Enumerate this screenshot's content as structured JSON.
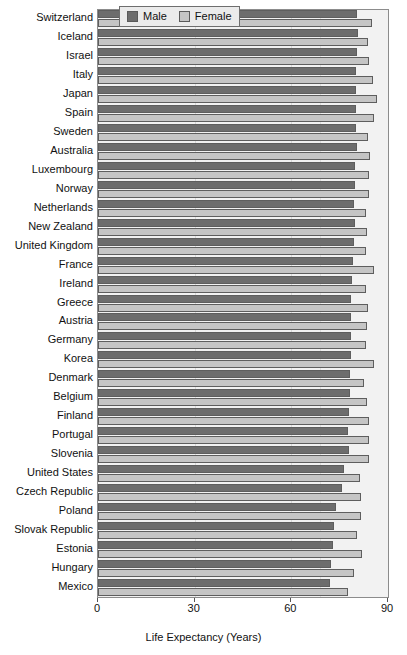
{
  "chart_data": {
    "type": "bar",
    "orientation": "horizontal",
    "title": "",
    "xlabel": "Life Expectancy (Years)",
    "ylabel": "",
    "xlim": [
      0,
      90
    ],
    "xticks": [
      0,
      30,
      60,
      90
    ],
    "xticklabels": [
      "0",
      "30",
      "60",
      "90"
    ],
    "grid": true,
    "legend": {
      "position": "top",
      "entries": [
        "Male",
        "Female"
      ]
    },
    "categories": [
      "Switzerland",
      "Iceland",
      "Israel",
      "Italy",
      "Japan",
      "Spain",
      "Sweden",
      "Australia",
      "Luxembourg",
      "Norway",
      "Netherlands",
      "New Zealand",
      "United Kingdom",
      "France",
      "Ireland",
      "Greece",
      "Austria",
      "Germany",
      "Korea",
      "Denmark",
      "Belgium",
      "Finland",
      "Portugal",
      "Slovenia",
      "United States",
      "Czech Republic",
      "Poland",
      "Slovak Republic",
      "Estonia",
      "Hungary",
      "Mexico"
    ],
    "series": [
      {
        "name": "Male",
        "color": "#6d6d6d",
        "values": [
          80.5,
          80.6,
          80.3,
          80.2,
          80.0,
          80.0,
          80.1,
          80.3,
          79.8,
          79.8,
          79.5,
          79.7,
          79.4,
          79.0,
          78.7,
          78.5,
          78.6,
          78.6,
          78.5,
          78.3,
          78.1,
          78.0,
          77.6,
          77.8,
          76.4,
          75.8,
          73.8,
          73.1,
          72.8,
          72.2,
          72.1
        ]
      },
      {
        "name": "Female",
        "color": "#c5c5c5",
        "values": [
          84.9,
          83.8,
          84.0,
          85.2,
          86.6,
          85.8,
          83.8,
          84.5,
          84.0,
          84.0,
          83.2,
          83.4,
          83.1,
          85.6,
          83.2,
          83.7,
          83.6,
          83.3,
          85.5,
          82.5,
          83.4,
          84.1,
          84.0,
          84.1,
          81.4,
          81.5,
          81.6,
          80.4,
          81.9,
          79.3,
          77.5
        ]
      }
    ]
  },
  "legend": {
    "male_label": "Male",
    "female_label": "Female"
  },
  "axis": {
    "x_title": "Life Expectancy (Years)"
  }
}
